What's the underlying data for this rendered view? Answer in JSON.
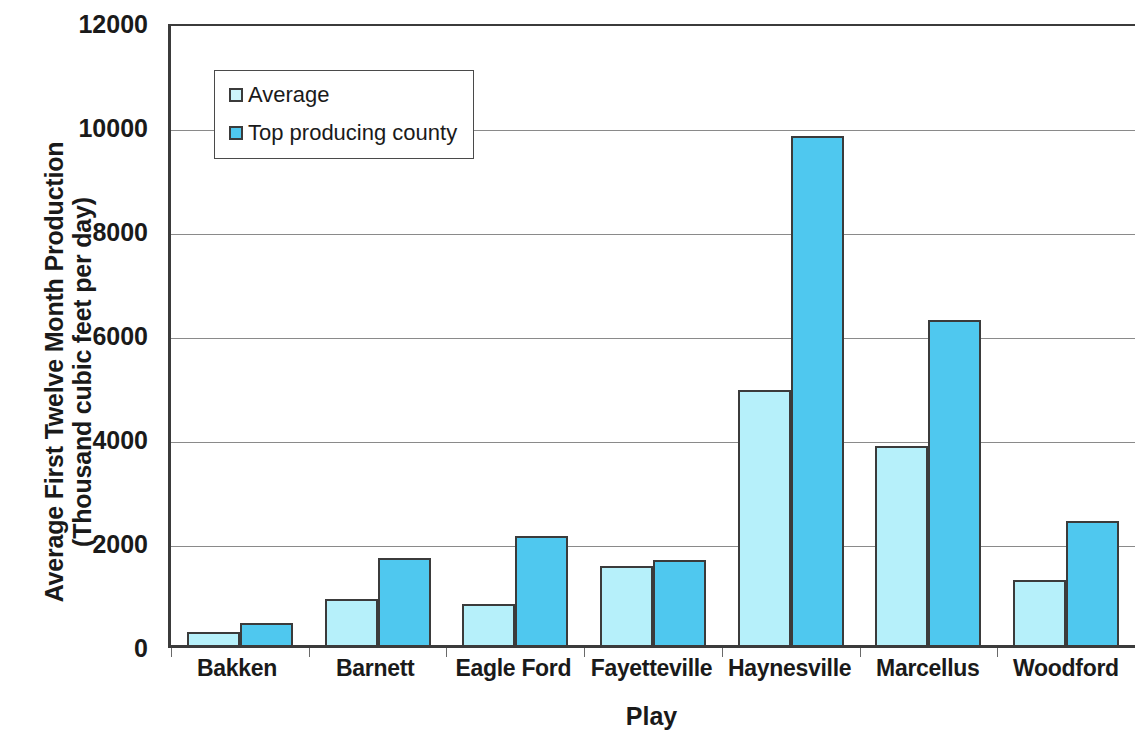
{
  "chart_data": {
    "type": "bar",
    "title": "",
    "xlabel": "Play",
    "ylabel": "Average First Twelve Month Production (Thousand cubic feet per day)",
    "ylabel_lines": [
      "Average First Twelve Month Production",
      "(Thousand cubic feet per day)"
    ],
    "categories": [
      "Bakken",
      "Barnett",
      "Eagle Ford",
      "Fayetteville",
      "Haynesville",
      "Marcellus",
      "Woodford"
    ],
    "series": [
      {
        "name": "Average",
        "color": "#b6f0fa",
        "values": [
          300,
          950,
          850,
          1570,
          4960,
          3880,
          1310
        ]
      },
      {
        "name": "Top producing county",
        "color": "#4fc8ef",
        "values": [
          490,
          1730,
          2150,
          1690,
          9840,
          6310,
          2450
        ]
      }
    ],
    "ylim": [
      0,
      12000
    ],
    "yticks": [
      0,
      2000,
      4000,
      6000,
      8000,
      10000,
      12000
    ],
    "ytick_labels": [
      "0",
      "2000",
      "4000",
      "6000",
      "8000",
      "10000",
      "12000"
    ],
    "grid": true,
    "legend_position": "upper-left-inside",
    "colors": {
      "series_average": "#b6f0fa",
      "series_top_county": "#4fc8ef",
      "bar_outline": "#3b3b3b",
      "gridline": "#8a8a8a",
      "axis": "#3b3b3b",
      "text": "#1a1a1a"
    }
  }
}
